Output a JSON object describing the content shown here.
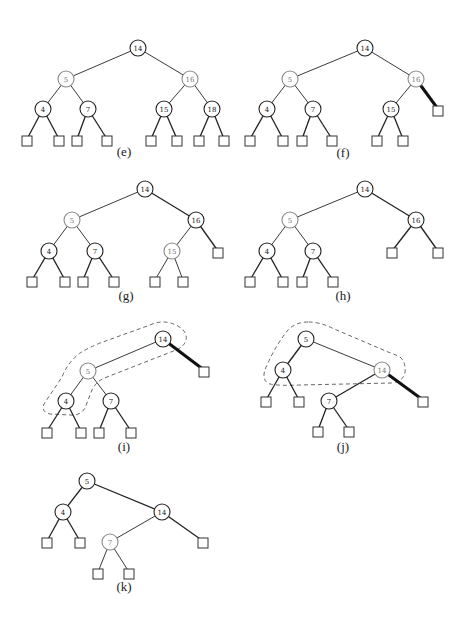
{
  "colors": {
    "black_node": "#222222",
    "red_node": "#8a8a8a",
    "thick_edge": "#111111"
  },
  "node_radius": 8,
  "leaf_size": 10,
  "panels": [
    {
      "id": "e",
      "label": "(e)",
      "label_pos": [
        124,
        156
      ],
      "nodes": [
        {
          "key": "14",
          "x": 138,
          "y": 48,
          "color": "black"
        },
        {
          "key": "5",
          "x": 66,
          "y": 79,
          "color": "red"
        },
        {
          "key": "16",
          "x": 190,
          "y": 79,
          "color": "red"
        },
        {
          "key": "4",
          "x": 43,
          "y": 109,
          "color": "black"
        },
        {
          "key": "7",
          "x": 88,
          "y": 109,
          "color": "black"
        },
        {
          "key": "15",
          "x": 164,
          "y": 109,
          "color": "black"
        },
        {
          "key": "18",
          "x": 212,
          "y": 109,
          "color": "black"
        }
      ],
      "leaves": [
        [
          27,
          139
        ],
        [
          59,
          139
        ],
        [
          77,
          139
        ],
        [
          107,
          139
        ],
        [
          151,
          139
        ],
        [
          177,
          139
        ],
        [
          199,
          139
        ],
        [
          224,
          139
        ]
      ],
      "edges": [
        {
          "from": [
            138,
            48
          ],
          "to": [
            66,
            79
          ]
        },
        {
          "from": [
            138,
            48
          ],
          "to": [
            190,
            79
          ]
        },
        {
          "from": [
            66,
            79
          ],
          "to": [
            43,
            109
          ]
        },
        {
          "from": [
            66,
            79
          ],
          "to": [
            88,
            109
          ]
        },
        {
          "from": [
            190,
            79
          ],
          "to": [
            164,
            109
          ]
        },
        {
          "from": [
            190,
            79
          ],
          "to": [
            212,
            109
          ]
        },
        {
          "from": [
            43,
            109
          ],
          "to": [
            27,
            139
          ],
          "style": "black"
        },
        {
          "from": [
            43,
            109
          ],
          "to": [
            59,
            139
          ],
          "style": "black"
        },
        {
          "from": [
            88,
            109
          ],
          "to": [
            77,
            139
          ],
          "style": "black"
        },
        {
          "from": [
            88,
            109
          ],
          "to": [
            107,
            139
          ],
          "style": "black"
        },
        {
          "from": [
            164,
            109
          ],
          "to": [
            151,
            139
          ],
          "style": "black"
        },
        {
          "from": [
            164,
            109
          ],
          "to": [
            177,
            139
          ],
          "style": "black"
        },
        {
          "from": [
            212,
            109
          ],
          "to": [
            199,
            139
          ],
          "style": "black"
        },
        {
          "from": [
            212,
            109
          ],
          "to": [
            224,
            139
          ],
          "style": "black"
        }
      ]
    },
    {
      "id": "f",
      "label": "(f)",
      "label_pos": [
        343,
        157
      ],
      "nodes": [
        {
          "key": "14",
          "x": 365,
          "y": 48,
          "color": "black"
        },
        {
          "key": "5",
          "x": 290,
          "y": 79,
          "color": "red"
        },
        {
          "key": "16",
          "x": 416,
          "y": 79,
          "color": "red"
        },
        {
          "key": "4",
          "x": 267,
          "y": 109,
          "color": "black"
        },
        {
          "key": "7",
          "x": 313,
          "y": 109,
          "color": "black"
        },
        {
          "key": "15",
          "x": 391,
          "y": 109,
          "color": "black"
        }
      ],
      "leaves": [
        [
          438,
          109
        ],
        [
          250,
          139
        ],
        [
          283,
          139
        ],
        [
          302,
          139
        ],
        [
          332,
          139
        ],
        [
          377,
          139
        ],
        [
          403,
          139
        ]
      ],
      "edges": [
        {
          "from": [
            365,
            48
          ],
          "to": [
            290,
            79
          ]
        },
        {
          "from": [
            365,
            48
          ],
          "to": [
            416,
            79
          ]
        },
        {
          "from": [
            290,
            79
          ],
          "to": [
            267,
            109
          ]
        },
        {
          "from": [
            290,
            79
          ],
          "to": [
            313,
            109
          ]
        },
        {
          "from": [
            416,
            79
          ],
          "to": [
            391,
            109
          ]
        },
        {
          "from": [
            416,
            79
          ],
          "to": [
            438,
            109
          ],
          "style": "thick"
        },
        {
          "from": [
            267,
            109
          ],
          "to": [
            250,
            139
          ],
          "style": "black"
        },
        {
          "from": [
            267,
            109
          ],
          "to": [
            283,
            139
          ],
          "style": "black"
        },
        {
          "from": [
            313,
            109
          ],
          "to": [
            302,
            139
          ],
          "style": "black"
        },
        {
          "from": [
            313,
            109
          ],
          "to": [
            332,
            139
          ],
          "style": "black"
        },
        {
          "from": [
            391,
            109
          ],
          "to": [
            377,
            139
          ],
          "style": "black"
        },
        {
          "from": [
            391,
            109
          ],
          "to": [
            403,
            139
          ],
          "style": "black"
        }
      ]
    },
    {
      "id": "g",
      "label": "(g)",
      "label_pos": [
        126,
        300
      ],
      "nodes": [
        {
          "key": "14",
          "x": 145,
          "y": 189,
          "color": "black"
        },
        {
          "key": "5",
          "x": 72,
          "y": 220,
          "color": "red"
        },
        {
          "key": "16",
          "x": 196,
          "y": 220,
          "color": "black"
        },
        {
          "key": "4",
          "x": 49,
          "y": 251,
          "color": "black"
        },
        {
          "key": "7",
          "x": 95,
          "y": 251,
          "color": "black"
        },
        {
          "key": "15",
          "x": 172,
          "y": 251,
          "color": "red"
        }
      ],
      "leaves": [
        [
          218,
          251
        ],
        [
          32,
          280
        ],
        [
          65,
          280
        ],
        [
          83,
          280
        ],
        [
          114,
          280
        ],
        [
          155,
          280
        ],
        [
          183,
          280
        ]
      ],
      "edges": [
        {
          "from": [
            145,
            189
          ],
          "to": [
            72,
            220
          ]
        },
        {
          "from": [
            145,
            189
          ],
          "to": [
            196,
            220
          ],
          "style": "black"
        },
        {
          "from": [
            72,
            220
          ],
          "to": [
            49,
            251
          ]
        },
        {
          "from": [
            72,
            220
          ],
          "to": [
            95,
            251
          ]
        },
        {
          "from": [
            196,
            220
          ],
          "to": [
            172,
            251
          ]
        },
        {
          "from": [
            196,
            220
          ],
          "to": [
            218,
            251
          ],
          "style": "black"
        },
        {
          "from": [
            49,
            251
          ],
          "to": [
            32,
            280
          ],
          "style": "black"
        },
        {
          "from": [
            49,
            251
          ],
          "to": [
            65,
            280
          ],
          "style": "black"
        },
        {
          "from": [
            95,
            251
          ],
          "to": [
            83,
            280
          ],
          "style": "black"
        },
        {
          "from": [
            95,
            251
          ],
          "to": [
            114,
            280
          ],
          "style": "black"
        },
        {
          "from": [
            172,
            251
          ],
          "to": [
            155,
            280
          ]
        },
        {
          "from": [
            172,
            251
          ],
          "to": [
            183,
            280
          ]
        }
      ]
    },
    {
      "id": "h",
      "label": "(h)",
      "label_pos": [
        343,
        300
      ],
      "nodes": [
        {
          "key": "14",
          "x": 365,
          "y": 189,
          "color": "black"
        },
        {
          "key": "5",
          "x": 290,
          "y": 220,
          "color": "red"
        },
        {
          "key": "16",
          "x": 416,
          "y": 220,
          "color": "black"
        },
        {
          "key": "4",
          "x": 267,
          "y": 251,
          "color": "black"
        },
        {
          "key": "7",
          "x": 313,
          "y": 251,
          "color": "black"
        }
      ],
      "leaves": [
        [
          392,
          251
        ],
        [
          438,
          251
        ],
        [
          250,
          280
        ],
        [
          283,
          280
        ],
        [
          302,
          280
        ],
        [
          333,
          280
        ]
      ],
      "edges": [
        {
          "from": [
            365,
            189
          ],
          "to": [
            290,
            220
          ]
        },
        {
          "from": [
            365,
            189
          ],
          "to": [
            416,
            220
          ],
          "style": "black"
        },
        {
          "from": [
            290,
            220
          ],
          "to": [
            267,
            251
          ]
        },
        {
          "from": [
            290,
            220
          ],
          "to": [
            313,
            251
          ]
        },
        {
          "from": [
            416,
            220
          ],
          "to": [
            392,
            251
          ],
          "style": "black"
        },
        {
          "from": [
            416,
            220
          ],
          "to": [
            438,
            251
          ],
          "style": "black"
        },
        {
          "from": [
            267,
            251
          ],
          "to": [
            250,
            280
          ],
          "style": "black"
        },
        {
          "from": [
            267,
            251
          ],
          "to": [
            283,
            280
          ],
          "style": "black"
        },
        {
          "from": [
            313,
            251
          ],
          "to": [
            302,
            280
          ],
          "style": "black"
        },
        {
          "from": [
            313,
            251
          ],
          "to": [
            333,
            280
          ],
          "style": "black"
        }
      ]
    },
    {
      "id": "i",
      "label": "(i)",
      "label_pos": [
        124,
        451
      ],
      "nodes": [
        {
          "key": "14",
          "x": 163,
          "y": 339,
          "color": "black"
        },
        {
          "key": "5",
          "x": 88,
          "y": 371,
          "color": "red"
        },
        {
          "key": "4",
          "x": 66,
          "y": 401,
          "color": "black"
        },
        {
          "key": "7",
          "x": 111,
          "y": 401,
          "color": "black"
        }
      ],
      "leaves": [
        [
          204,
          370
        ],
        [
          47,
          431
        ],
        [
          81,
          431
        ],
        [
          99,
          431
        ],
        [
          131,
          431
        ]
      ],
      "edges": [
        {
          "from": [
            163,
            339
          ],
          "to": [
            88,
            371
          ]
        },
        {
          "from": [
            163,
            339
          ],
          "to": [
            204,
            370
          ],
          "style": "thick"
        },
        {
          "from": [
            88,
            371
          ],
          "to": [
            66,
            401
          ]
        },
        {
          "from": [
            88,
            371
          ],
          "to": [
            111,
            401
          ]
        },
        {
          "from": [
            66,
            401
          ],
          "to": [
            47,
            431
          ],
          "style": "black"
        },
        {
          "from": [
            66,
            401
          ],
          "to": [
            81,
            431
          ],
          "style": "black"
        },
        {
          "from": [
            111,
            401
          ],
          "to": [
            99,
            431
          ],
          "style": "black"
        },
        {
          "from": [
            111,
            401
          ],
          "to": [
            131,
            431
          ],
          "style": "black"
        }
      ],
      "dashed_outline": "M150 325 Q163 319 176 325 Q188 331 186 340 Q184 347 176 350 L107 377 Q96 381 92 390 L85 408 Q80 416 70 415 L50 414 Q41 412 44 404 L62 377 Q68 362 80 353 Q88 348 100 343 Z"
    },
    {
      "id": "j",
      "label": "(j)",
      "label_pos": [
        343,
        451
      ],
      "nodes": [
        {
          "key": "5",
          "x": 306,
          "y": 339,
          "color": "black"
        },
        {
          "key": "4",
          "x": 283,
          "y": 370,
          "color": "black"
        },
        {
          "key": "14",
          "x": 382,
          "y": 370,
          "color": "red"
        },
        {
          "key": "7",
          "x": 329,
          "y": 401,
          "color": "black"
        }
      ],
      "leaves": [
        [
          266,
          400
        ],
        [
          299,
          400
        ],
        [
          423,
          400
        ],
        [
          318,
          430
        ],
        [
          349,
          430
        ]
      ],
      "edges": [
        {
          "from": [
            306,
            339
          ],
          "to": [
            283,
            370
          ],
          "style": "black"
        },
        {
          "from": [
            306,
            339
          ],
          "to": [
            382,
            370
          ]
        },
        {
          "from": [
            382,
            370
          ],
          "to": [
            329,
            401
          ],
          "style": "black"
        },
        {
          "from": [
            382,
            370
          ],
          "to": [
            423,
            400
          ],
          "style": "thick"
        },
        {
          "from": [
            283,
            370
          ],
          "to": [
            266,
            400
          ],
          "style": "black"
        },
        {
          "from": [
            283,
            370
          ],
          "to": [
            299,
            400
          ],
          "style": "black"
        },
        {
          "from": [
            329,
            401
          ],
          "to": [
            318,
            430
          ],
          "style": "black"
        },
        {
          "from": [
            329,
            401
          ],
          "to": [
            349,
            430
          ],
          "style": "black"
        }
      ],
      "dashed_outline": "M308 322 Q296 322 288 330 Q276 345 268 363 Q259 380 270 384 Q280 386 300 385 L392 383 Q404 381 405 372 Q406 362 400 357 Q394 354 388 352 L332 328 Q320 322 308 322 Z"
    },
    {
      "id": "k",
      "label": "(k)",
      "label_pos": [
        124,
        591
      ],
      "nodes": [
        {
          "key": "5",
          "x": 87,
          "y": 481,
          "color": "black"
        },
        {
          "key": "4",
          "x": 63,
          "y": 512,
          "color": "black"
        },
        {
          "key": "14",
          "x": 162,
          "y": 512,
          "color": "black"
        },
        {
          "key": "7",
          "x": 110,
          "y": 542,
          "color": "red"
        }
      ],
      "leaves": [
        [
          47,
          541
        ],
        [
          80,
          541
        ],
        [
          203,
          541
        ],
        [
          98,
          572
        ],
        [
          129,
          572
        ]
      ],
      "edges": [
        {
          "from": [
            87,
            481
          ],
          "to": [
            63,
            512
          ],
          "style": "black"
        },
        {
          "from": [
            87,
            481
          ],
          "to": [
            162,
            512
          ],
          "style": "black"
        },
        {
          "from": [
            162,
            512
          ],
          "to": [
            110,
            542
          ]
        },
        {
          "from": [
            162,
            512
          ],
          "to": [
            203,
            541
          ],
          "style": "black"
        },
        {
          "from": [
            63,
            512
          ],
          "to": [
            47,
            541
          ],
          "style": "black"
        },
        {
          "from": [
            63,
            512
          ],
          "to": [
            80,
            541
          ],
          "style": "black"
        },
        {
          "from": [
            110,
            542
          ],
          "to": [
            98,
            572
          ]
        },
        {
          "from": [
            110,
            542
          ],
          "to": [
            129,
            572
          ]
        }
      ]
    }
  ]
}
